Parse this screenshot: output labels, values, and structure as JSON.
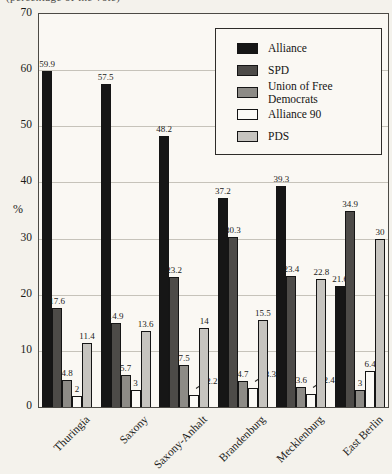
{
  "caption_partial": "(percentage of the vote)",
  "chart_data": {
    "type": "bar",
    "title": "",
    "xlabel": "",
    "ylabel": "%",
    "ylim": [
      0,
      70
    ],
    "yticks": [
      70,
      60,
      50,
      40,
      30,
      20,
      10,
      0
    ],
    "grid": "horizontal",
    "legend_position": "top-right",
    "categories": [
      "Thuringia",
      "Saxony",
      "Saxony-Anhalt",
      "Brandenburg",
      "Mecklenburg",
      "East Berlin"
    ],
    "series": [
      {
        "name": "Alliance",
        "color": "#161616",
        "values": [
          59.9,
          57.5,
          48.2,
          37.2,
          39.3,
          21.6
        ]
      },
      {
        "name": "SPD",
        "color": "#4d4b48",
        "values": [
          17.6,
          14.9,
          23.2,
          30.3,
          23.4,
          34.9
        ]
      },
      {
        "name": "Union of Free Democrats",
        "color": "#8d8b86",
        "values": [
          4.8,
          5.7,
          7.5,
          4.7,
          3.6,
          3
        ]
      },
      {
        "name": "Alliance 90",
        "color": "#fbfaf6",
        "values": [
          2,
          3,
          2.2,
          3.3,
          2.4,
          6.4
        ]
      },
      {
        "name": "PDS",
        "color": "#c6c4bf",
        "values": [
          11.4,
          13.6,
          14,
          15.5,
          22.8,
          30
        ]
      }
    ],
    "label_callouts": [
      {
        "category": "Saxony-Anhalt",
        "series": "Alliance 90"
      },
      {
        "category": "Brandenburg",
        "series": "Alliance 90"
      },
      {
        "category": "Mecklenburg",
        "series": "Alliance 90"
      }
    ]
  }
}
